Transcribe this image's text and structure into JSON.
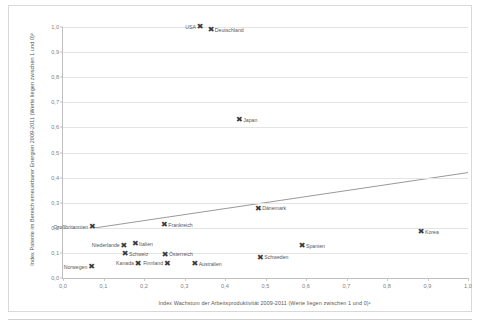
{
  "chart_data": {
    "type": "scatter",
    "title": "",
    "xlabel": "Index Wachstum der Arbeitsproduktivität 2009-2011 (Werte liegen zwischen 1 und 0)¹",
    "ylabel": "Index Patente im Bereich erneuerbarer Energien 2009-2011 (Werte liegen zwischen 1 und 0)²",
    "xlim": [
      0.0,
      1.0
    ],
    "ylim": [
      0.0,
      1.0
    ],
    "xticks": [
      "0,0",
      "0,1",
      "0,2",
      "0,3",
      "0,4",
      "0,5",
      "0,6",
      "0,7",
      "0,8",
      "0,9",
      "1,0"
    ],
    "xtick_values": [
      0.0,
      0.1,
      0.2,
      0.3,
      0.4,
      0.5,
      0.6,
      0.7,
      0.8,
      0.9,
      1.0
    ],
    "yticks": [
      "0,0",
      "0,1",
      "0,2",
      "0,3",
      "0,4",
      "0,5",
      "0,6",
      "0,7",
      "0,8",
      "0,9",
      "1,0"
    ],
    "ytick_values": [
      0.0,
      0.1,
      0.2,
      0.3,
      0.4,
      0.5,
      0.6,
      0.7,
      0.8,
      0.9,
      1.0
    ],
    "grid": "horizontal",
    "legend": "none",
    "marker": "x-cross",
    "marker_color": "#3a3a3a",
    "points": [
      {
        "label": "USA",
        "x": 0.338,
        "y": 1.0,
        "label_pos": "left"
      },
      {
        "label": "Deutschland",
        "x": 0.365,
        "y": 0.99,
        "label_pos": "right"
      },
      {
        "label": "Japan",
        "x": 0.435,
        "y": 0.63,
        "label_pos": "right"
      },
      {
        "label": "Dänemark",
        "x": 0.482,
        "y": 0.277,
        "label_pos": "right"
      },
      {
        "label": "Korea",
        "x": 0.884,
        "y": 0.183,
        "label_pos": "right"
      },
      {
        "label": "Frankreich",
        "x": 0.25,
        "y": 0.213,
        "label_pos": "right"
      },
      {
        "label": "Großbritannien",
        "x": 0.072,
        "y": 0.205,
        "label_pos": "left"
      },
      {
        "label": "Spanien",
        "x": 0.59,
        "y": 0.128,
        "label_pos": "right"
      },
      {
        "label": "Italien",
        "x": 0.178,
        "y": 0.137,
        "label_pos": "right"
      },
      {
        "label": "Niederlande",
        "x": 0.15,
        "y": 0.13,
        "label_pos": "left"
      },
      {
        "label": "Schweiz",
        "x": 0.153,
        "y": 0.097,
        "label_pos": "right"
      },
      {
        "label": "Schweden",
        "x": 0.487,
        "y": 0.083,
        "label_pos": "right"
      },
      {
        "label": "Österreich",
        "x": 0.252,
        "y": 0.095,
        "label_pos": "right"
      },
      {
        "label": "Finnland",
        "x": 0.257,
        "y": 0.058,
        "label_pos": "left"
      },
      {
        "label": "Kanada",
        "x": 0.185,
        "y": 0.058,
        "label_pos": "left"
      },
      {
        "label": "Australien",
        "x": 0.325,
        "y": 0.057,
        "label_pos": "right"
      },
      {
        "label": "Norwegen",
        "x": 0.07,
        "y": 0.044,
        "label_pos": "left"
      }
    ],
    "trendline": {
      "type": "linear",
      "x_start": 0.072,
      "y_start": 0.198,
      "x_end": 1.0,
      "y_end": 0.42,
      "color": "#7f7f7f"
    }
  }
}
